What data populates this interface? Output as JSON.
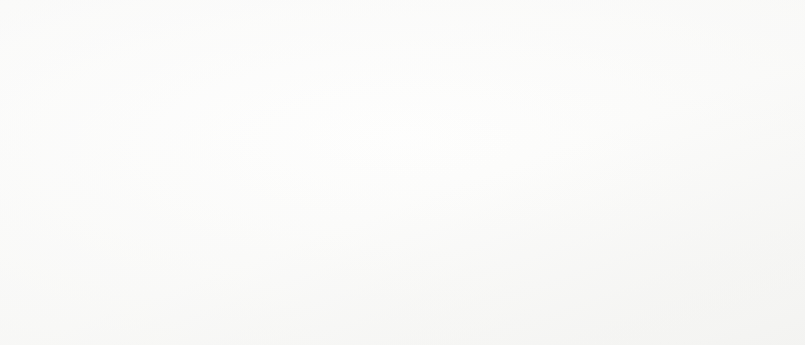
{
  "figure": {
    "label_word": "FIGURE",
    "number": "3.54",
    "title": "Chloroplasts",
    "caption_part1": "These harvest the energy of sunlight to generate ATP. The ATP is then used to convert CO",
    "caption_subscript": "2",
    "caption_part2": " to an organic form.",
    "caption_full": "FIGURE 3.54 Chloroplasts These harvest the energy of sunlight to generate ATP. The ATP is then used to convert CO2 to an organic form."
  },
  "callouts": [
    {
      "id": "outer-membrane",
      "label": "Outer membrane",
      "x": 540,
      "y": 113
    },
    {
      "id": "inner-membrane",
      "label": "Inner membrane",
      "x": 540,
      "y": 143
    },
    {
      "id": "thylakoid",
      "label": "Thylakoid",
      "x": 540,
      "y": 180
    },
    {
      "id": "stroma",
      "label": "Stroma",
      "x": 385,
      "y": 256
    }
  ],
  "panels": [
    {
      "id": "plant-cell",
      "name": "Plant cell cutaway illustration"
    },
    {
      "id": "chloroplast-cutaway",
      "name": "Chloroplast cutaway illustration"
    },
    {
      "id": "chloroplast-em",
      "name": "Chloroplast electron micrograph"
    }
  ],
  "colors": {
    "page_background": "#ffffff",
    "ink": "#1b1b1b",
    "leader_line": "#2a2a2a",
    "art_light": "#e6e6e4",
    "art_mid": "#b9b9b6",
    "art_dark": "#6f6f6c",
    "em_dark": "#101010"
  }
}
